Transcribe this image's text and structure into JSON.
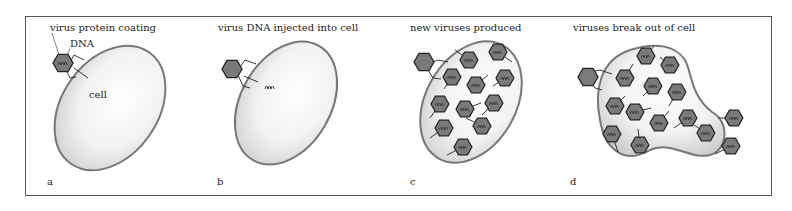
{
  "panels": [
    {
      "letter": "a",
      "title": "virus protein coating",
      "labels": {
        "dna": "DNA",
        "cell": "cell"
      }
    },
    {
      "letter": "b",
      "title": "virus DNA injected into cell"
    },
    {
      "letter": "c",
      "title": "new viruses produced"
    },
    {
      "letter": "d",
      "title": "viruses break out of cell"
    }
  ],
  "colors": {
    "virus_fill": "#7a7a7a",
    "virus_stroke": "#222222",
    "cell_stroke": "#777777",
    "frame": "#555555"
  }
}
